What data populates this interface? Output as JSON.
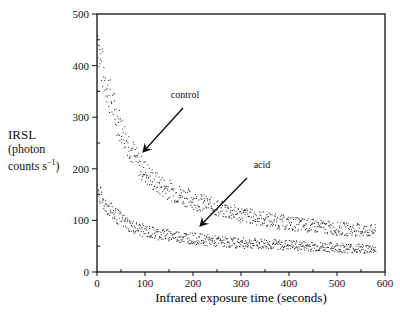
{
  "chart_data": {
    "type": "scatter",
    "title": "",
    "xlabel": "Infrared exposure time (seconds)",
    "ylabel": "IRSL (photon counts s-1)",
    "ylabel_lines": [
      "IRSL",
      "(photon",
      "counts s"
    ],
    "ylabel_sup": "−1",
    "xlim": [
      0,
      600
    ],
    "ylim": [
      0,
      500
    ],
    "xticks": [
      0,
      100,
      200,
      300,
      400,
      500,
      600
    ],
    "yticks": [
      0,
      100,
      200,
      300,
      400,
      500
    ],
    "grid": false,
    "series": [
      {
        "name": "control",
        "x": [
          0,
          5,
          10,
          20,
          30,
          40,
          50,
          60,
          70,
          80,
          90,
          100,
          120,
          140,
          160,
          180,
          200,
          250,
          300,
          350,
          400,
          450,
          500,
          550,
          580
        ],
        "y": [
          460,
          420,
          395,
          360,
          330,
          300,
          280,
          260,
          240,
          220,
          205,
          195,
          175,
          165,
          155,
          148,
          140,
          125,
          112,
          103,
          95,
          90,
          85,
          82,
          80
        ]
      },
      {
        "name": "acid",
        "x": [
          0,
          5,
          10,
          20,
          30,
          40,
          50,
          60,
          70,
          80,
          100,
          120,
          150,
          200,
          250,
          300,
          350,
          400,
          450,
          500,
          550,
          580
        ],
        "y": [
          165,
          150,
          140,
          128,
          118,
          110,
          102,
          96,
          90,
          86,
          80,
          76,
          72,
          66,
          60,
          57,
          55,
          53,
          50,
          48,
          46,
          45
        ]
      }
    ],
    "annotations": [
      {
        "text": "control",
        "label_x": 185,
        "label_y": 98,
        "arrow_from": [
          183,
          108
        ],
        "arrow_to": [
          143,
          152
        ]
      },
      {
        "text": "acid",
        "label_x": 262,
        "label_y": 168,
        "arrow_from": [
          247,
          178
        ],
        "arrow_to": [
          200,
          226
        ]
      }
    ]
  }
}
